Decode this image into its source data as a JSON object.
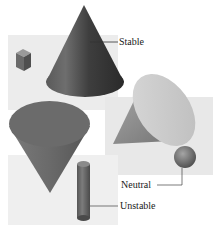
{
  "figure": {
    "labels": {
      "stable": "Stable",
      "neutral": "Neutral",
      "unstable": "Unstable"
    },
    "objects": [
      {
        "name": "cube",
        "state": "stable"
      },
      {
        "name": "cone-on-base",
        "state": "stable"
      },
      {
        "name": "cone-on-side",
        "state": "neutral"
      },
      {
        "name": "sphere",
        "state": "neutral"
      },
      {
        "name": "cone-on-tip",
        "state": "unstable"
      },
      {
        "name": "cylinder-upright",
        "state": "unstable"
      }
    ],
    "colors": {
      "panel": "#ebebeb",
      "dark_cone": "#4a4a4a",
      "light_cone": "#cfcfcf",
      "mid_shape": "#7a7a7a",
      "leader_line": "#333333"
    }
  }
}
